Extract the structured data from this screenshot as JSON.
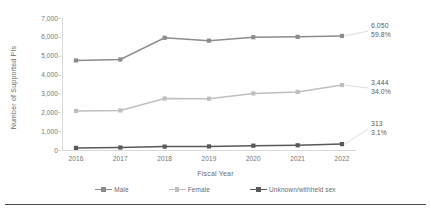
{
  "chart_data": {
    "type": "line",
    "title": "",
    "xlabel": "Fiscal Year",
    "ylabel": "Number of Supported PIs",
    "categories": [
      "2016",
      "2017",
      "2018",
      "2019",
      "2020",
      "2021",
      "2022"
    ],
    "ylim": [
      0,
      7000
    ],
    "yticks": [
      "0",
      "1,000",
      "2,000",
      "3,000",
      "4,000",
      "5,000",
      "6,000",
      "7,000"
    ],
    "ytick_values": [
      0,
      1000,
      2000,
      3000,
      4000,
      5000,
      6000,
      7000
    ],
    "grid": false,
    "legend_position": "bottom",
    "series": [
      {
        "name": "Male",
        "color": "#8c8c8c",
        "values": [
          4750,
          4800,
          5950,
          5800,
          5980,
          6000,
          6050
        ],
        "end_label": {
          "value": "6,050",
          "percent": "59.8%"
        }
      },
      {
        "name": "Female",
        "color": "#bfbfbf",
        "values": [
          2070,
          2100,
          2730,
          2720,
          3000,
          3080,
          3444
        ],
        "end_label": {
          "value": "3,444",
          "percent": "34.0%"
        }
      },
      {
        "name": "Unknown/withheld sex",
        "color": "#595959",
        "values": [
          110,
          130,
          180,
          190,
          230,
          250,
          313
        ],
        "end_label": {
          "value": "313",
          "percent": "3.1%"
        }
      }
    ]
  },
  "axis": {
    "x_title": "Fiscal Year",
    "y_title": "Number of Supported PIs"
  },
  "legend": {
    "items": [
      {
        "label": "Male"
      },
      {
        "label": "Female"
      },
      {
        "label": "Unknown/withheld sex"
      }
    ]
  },
  "colors": {
    "male": "#8c8c8c",
    "female": "#bfbfbf",
    "unknown": "#595959",
    "axis": "#d9d9d9",
    "text": "#6b6b6b"
  }
}
